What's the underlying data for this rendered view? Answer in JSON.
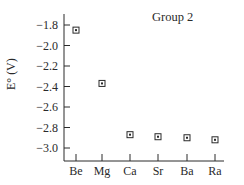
{
  "chart_data": {
    "type": "scatter",
    "title": "Group 2",
    "xlabel": "",
    "ylabel": "E° (V)",
    "categories": [
      "Be",
      "Mg",
      "Ca",
      "Sr",
      "Ba",
      "Ra"
    ],
    "values": [
      -1.85,
      -2.37,
      -2.87,
      -2.89,
      -2.9,
      -2.92
    ],
    "yticks": [
      -1.8,
      -2.0,
      -2.2,
      -2.4,
      -2.6,
      -2.8,
      -3.0
    ],
    "ytick_labels": [
      "−1.8",
      "−2.0",
      "−2.2",
      "−2.4",
      "−2.6",
      "−2.8",
      "−3.0"
    ],
    "ylim": [
      -3.12,
      -1.75
    ],
    "grid": false,
    "legend": null,
    "marker": "square-with-center-dot",
    "colors": {
      "axis": "#2a2a2a",
      "marker": "#2a2a2a"
    }
  }
}
